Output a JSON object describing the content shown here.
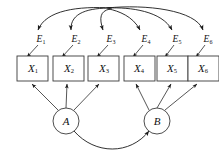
{
  "diagram": {
    "type": "path-diagram",
    "canvas": {
      "width": 219,
      "height": 160
    },
    "style": {
      "background_color": "#ffffff",
      "stroke_color": "#1a1a1a",
      "node_fill": "#ffffff",
      "node_stroke": "#3a3a3a"
    },
    "observed_variables": [
      {
        "id": "X1",
        "base": "X",
        "subscript": "1",
        "shape": "rectangle",
        "cx": 33,
        "cy": 69
      },
      {
        "id": "X2",
        "base": "X",
        "subscript": "2",
        "shape": "rectangle",
        "cx": 69,
        "cy": 69
      },
      {
        "id": "X3",
        "base": "X",
        "subscript": "3",
        "shape": "rectangle",
        "cx": 104,
        "cy": 69
      },
      {
        "id": "X4",
        "base": "X",
        "subscript": "4",
        "shape": "rectangle",
        "cx": 139,
        "cy": 69
      },
      {
        "id": "X5",
        "base": "X",
        "subscript": "5",
        "shape": "rectangle",
        "cx": 172,
        "cy": 69
      },
      {
        "id": "X6",
        "base": "X",
        "subscript": "6",
        "shape": "rectangle",
        "cx": 203,
        "cy": 69
      }
    ],
    "error_terms": [
      {
        "id": "E1",
        "base": "E",
        "subscript": "1",
        "x": 41,
        "y": 40,
        "target": "X1"
      },
      {
        "id": "E2",
        "base": "E",
        "subscript": "2",
        "x": 76,
        "y": 40,
        "target": "X2"
      },
      {
        "id": "E3",
        "base": "E",
        "subscript": "3",
        "x": 111,
        "y": 40,
        "target": "X3"
      },
      {
        "id": "E4",
        "base": "E",
        "subscript": "4",
        "x": 146,
        "y": 40,
        "target": "X4"
      },
      {
        "id": "E5",
        "base": "E",
        "subscript": "5",
        "x": 177,
        "y": 40,
        "target": "X5"
      },
      {
        "id": "E6",
        "base": "E",
        "subscript": "6",
        "x": 208,
        "y": 40,
        "target": "X6"
      }
    ],
    "latent_variables": [
      {
        "id": "A",
        "label": "A",
        "shape": "circle",
        "cx": 66,
        "cy": 121,
        "r": 13,
        "indicators": [
          "X1",
          "X2",
          "X3"
        ]
      },
      {
        "id": "B",
        "label": "B",
        "shape": "circle",
        "cx": 157,
        "cy": 121,
        "r": 13,
        "indicators": [
          "X4",
          "X5",
          "X6"
        ]
      }
    ],
    "loading_edges": [
      {
        "from": "A",
        "to": "X1",
        "kind": "directed"
      },
      {
        "from": "A",
        "to": "X2",
        "kind": "directed"
      },
      {
        "from": "A",
        "to": "X3",
        "kind": "directed"
      },
      {
        "from": "B",
        "to": "X4",
        "kind": "directed"
      },
      {
        "from": "B",
        "to": "X5",
        "kind": "directed"
      },
      {
        "from": "B",
        "to": "X6",
        "kind": "directed"
      }
    ],
    "error_edges": [
      {
        "from": "E1",
        "to": "X1",
        "kind": "directed"
      },
      {
        "from": "E2",
        "to": "X2",
        "kind": "directed"
      },
      {
        "from": "E3",
        "to": "X3",
        "kind": "directed"
      },
      {
        "from": "E4",
        "to": "X4",
        "kind": "directed"
      },
      {
        "from": "E5",
        "to": "X5",
        "kind": "directed"
      },
      {
        "from": "E6",
        "to": "X6",
        "kind": "directed"
      }
    ],
    "top_arcs": {
      "description": "Curved arcs from a shared apex fanning out to each error term",
      "apex_x": 110,
      "apex_y": 8,
      "count": 6
    },
    "factor_covariance": {
      "from": "A",
      "to": "B",
      "kind": "bidirectional-curved",
      "position": "below"
    }
  }
}
